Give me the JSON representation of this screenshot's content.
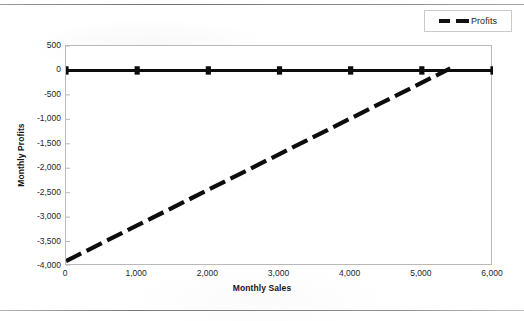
{
  "chart_data": {
    "type": "line",
    "title": "",
    "xlabel": "Monthly Sales",
    "ylabel": "Monthly Profits",
    "xlim": [
      0,
      6000
    ],
    "ylim": [
      -4000,
      500
    ],
    "xticks": [
      "0",
      "1,000",
      "2,000",
      "3,000",
      "4,000",
      "5,000",
      "6,000"
    ],
    "xtick_values": [
      0,
      1000,
      2000,
      3000,
      4000,
      5000,
      6000
    ],
    "yticks": [
      "500",
      "0",
      "-500",
      "-1,000",
      "-1,500",
      "-2,000",
      "-2,500",
      "-3,000",
      "-3,500",
      "-4,000"
    ],
    "ytick_values": [
      500,
      0,
      -500,
      -1000,
      -1500,
      -2000,
      -2500,
      -3000,
      -3500,
      -4000
    ],
    "grid": false,
    "legend_position": "top-right",
    "series": [
      {
        "name": "Zero Line",
        "style": "solid",
        "color": "#0d0d0d",
        "marker": "square",
        "x": [
          0,
          1000,
          2000,
          3000,
          4000,
          5000,
          6000
        ],
        "values": [
          0,
          0,
          0,
          0,
          0,
          0,
          0
        ]
      },
      {
        "name": "Profits",
        "style": "dashed",
        "color": "#0d0d0d",
        "marker": "none",
        "x": [
          0,
          1000,
          2000,
          3000,
          4000,
          5000,
          5400
        ],
        "values": [
          -3900,
          -3170,
          -2440,
          -1710,
          -980,
          -250,
          42
        ]
      }
    ],
    "legend": [
      {
        "label": "Profits",
        "style": "dashed",
        "color": "#0d0d0d"
      }
    ]
  }
}
